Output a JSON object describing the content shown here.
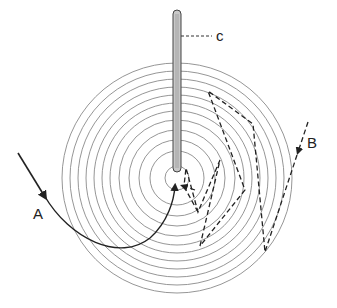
{
  "diagram": {
    "type": "concentric-rings-with-paths",
    "center": [
      177,
      178
    ],
    "ring_radii": [
      12,
      27,
      38,
      48,
      58,
      67,
      75,
      83,
      91,
      99,
      107,
      115
    ],
    "colors": {
      "ring": "#8a8a8a",
      "path": "#222222",
      "rod": "#bdbdbd"
    },
    "rod": {
      "label": "c",
      "x": 177,
      "top": 8,
      "bottom": 172,
      "width": 8
    },
    "labels": {
      "a": "A",
      "b": "B",
      "c": "c"
    },
    "path_a": {
      "style": "solid",
      "description": "curved trajectory entering from left, ending at center"
    },
    "path_b": {
      "style": "dashed",
      "description": "zig-zag trajectory entering from upper right, bouncing across rings to center"
    }
  }
}
